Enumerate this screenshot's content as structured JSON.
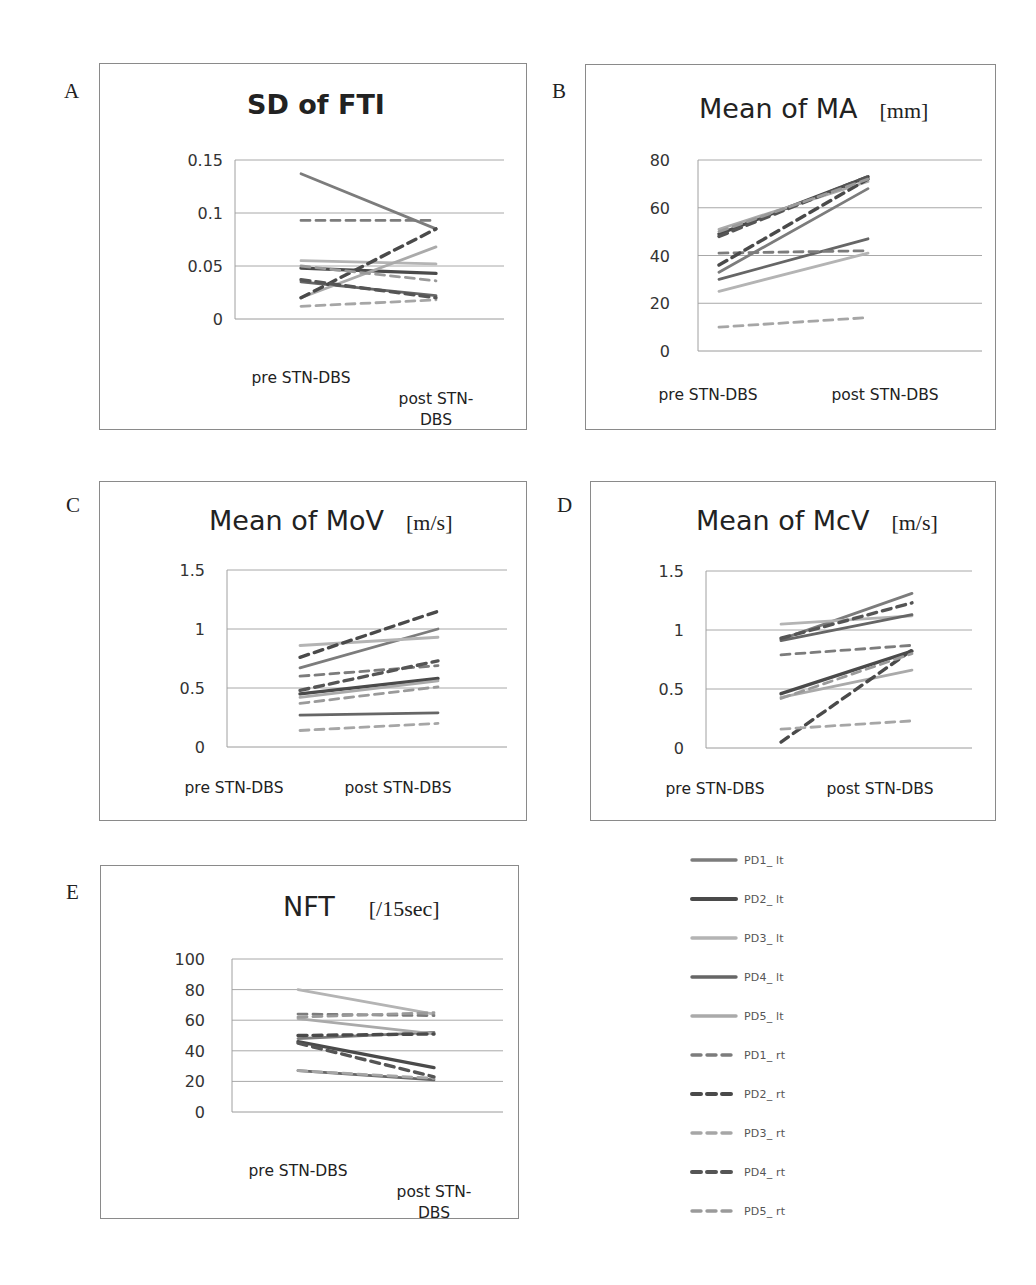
{
  "figure": {
    "panels": [
      {
        "letter": "A",
        "title": "SD of FTI",
        "unit": ""
      },
      {
        "letter": "B",
        "title": "Mean of MA",
        "unit": "[mm]"
      },
      {
        "letter": "C",
        "title": "Mean of MoV",
        "unit": "[m/s]"
      },
      {
        "letter": "D",
        "title": "Mean of McV",
        "unit": "[m/s]"
      },
      {
        "letter": "E",
        "title": "NFT",
        "unit": "[/15sec]"
      }
    ],
    "categories_wrapped": [
      "pre STN-DBS",
      "post STN-",
      "DBS"
    ],
    "categories_single": [
      "pre STN-DBS",
      "post STN-DBS"
    ]
  },
  "legend": {
    "items": [
      {
        "label": "PD1_ lt",
        "style": "solid",
        "color": "#7c7c7c"
      },
      {
        "label": "PD2_ lt",
        "style": "solid",
        "color": "#4a4a4a"
      },
      {
        "label": "PD3_ lt",
        "style": "solid",
        "color": "#b4b4b4"
      },
      {
        "label": "PD4_ lt",
        "style": "solid",
        "color": "#666666"
      },
      {
        "label": "PD5_ lt",
        "style": "solid",
        "color": "#aaaaaa"
      },
      {
        "label": "PD1_ rt",
        "style": "dashed",
        "color": "#7c7c7c"
      },
      {
        "label": "PD2_ rt",
        "style": "dashed",
        "color": "#4a4a4a"
      },
      {
        "label": "PD3_ rt",
        "style": "dashed",
        "color": "#a6a6a6"
      },
      {
        "label": "PD4_ rt",
        "style": "dashed",
        "color": "#555555"
      },
      {
        "label": "PD5_ rt",
        "style": "dashed",
        "color": "#9a9a9a"
      }
    ]
  },
  "chart_data": [
    {
      "panel": "A",
      "type": "line",
      "title": "SD of FTI",
      "xlabel": "",
      "ylabel": "",
      "categories": [
        "pre STN-DBS",
        "post STN-DBS"
      ],
      "yticks": [
        "0",
        "0.05",
        "0.1",
        "0.15"
      ],
      "ylim": [
        0,
        0.15
      ],
      "grid": true,
      "legend_position": "shared-right",
      "series": [
        {
          "name": "PD1_ lt",
          "values": [
            0.137,
            0.085
          ]
        },
        {
          "name": "PD2_ lt",
          "values": [
            0.048,
            0.043
          ]
        },
        {
          "name": "PD3_ lt",
          "values": [
            0.055,
            0.052
          ]
        },
        {
          "name": "PD4_ lt",
          "values": [
            0.035,
            0.022
          ]
        },
        {
          "name": "PD5_ lt",
          "values": [
            0.02,
            0.068
          ]
        },
        {
          "name": "PD1_ rt",
          "values": [
            0.093,
            0.093
          ]
        },
        {
          "name": "PD2_ rt",
          "values": [
            0.02,
            0.085
          ]
        },
        {
          "name": "PD3_ rt",
          "values": [
            0.012,
            0.018
          ]
        },
        {
          "name": "PD4_ rt",
          "values": [
            0.037,
            0.02
          ]
        },
        {
          "name": "PD5_ rt",
          "values": [
            0.05,
            0.036
          ]
        }
      ]
    },
    {
      "panel": "B",
      "type": "line",
      "title": "Mean of MA [mm]",
      "xlabel": "",
      "ylabel": "",
      "categories": [
        "pre STN-DBS",
        "post STN-DBS"
      ],
      "yticks": [
        "0",
        "20",
        "40",
        "60",
        "80"
      ],
      "ylim": [
        0,
        80
      ],
      "grid": true,
      "legend_position": "shared-right",
      "series": [
        {
          "name": "PD1_ lt",
          "values": [
            33,
            68
          ]
        },
        {
          "name": "PD2_ lt",
          "values": [
            49,
            73
          ]
        },
        {
          "name": "PD3_ lt",
          "values": [
            25,
            41
          ]
        },
        {
          "name": "PD4_ lt",
          "values": [
            30,
            47
          ]
        },
        {
          "name": "PD5_ lt",
          "values": [
            51,
            71
          ]
        },
        {
          "name": "PD1_ rt",
          "values": [
            41,
            42
          ]
        },
        {
          "name": "PD2_ rt",
          "values": [
            36,
            72
          ]
        },
        {
          "name": "PD3_ rt",
          "values": [
            10,
            14
          ]
        },
        {
          "name": "PD4_ rt",
          "values": [
            48,
            73
          ]
        },
        {
          "name": "PD5_ rt",
          "values": [
            50,
            72
          ]
        }
      ]
    },
    {
      "panel": "C",
      "type": "line",
      "title": "Mean of MoV [m/s]",
      "xlabel": "",
      "ylabel": "",
      "categories": [
        "pre STN-DBS",
        "post STN-DBS"
      ],
      "yticks": [
        "0",
        "0.5",
        "1",
        "1.5"
      ],
      "ylim": [
        0,
        1.5
      ],
      "grid": true,
      "legend_position": "shared-right",
      "series": [
        {
          "name": "PD1_ lt",
          "values": [
            0.67,
            1.0
          ]
        },
        {
          "name": "PD2_ lt",
          "values": [
            0.45,
            0.58
          ]
        },
        {
          "name": "PD3_ lt",
          "values": [
            0.86,
            0.93
          ]
        },
        {
          "name": "PD4_ lt",
          "values": [
            0.27,
            0.29
          ]
        },
        {
          "name": "PD5_ lt",
          "values": [
            0.42,
            0.56
          ]
        },
        {
          "name": "PD1_ rt",
          "values": [
            0.6,
            0.69
          ]
        },
        {
          "name": "PD2_ rt",
          "values": [
            0.76,
            1.15
          ]
        },
        {
          "name": "PD3_ rt",
          "values": [
            0.14,
            0.2
          ]
        },
        {
          "name": "PD4_ rt",
          "values": [
            0.48,
            0.73
          ]
        },
        {
          "name": "PD5_ rt",
          "values": [
            0.37,
            0.51
          ]
        }
      ]
    },
    {
      "panel": "D",
      "type": "line",
      "title": "Mean of McV [m/s]",
      "xlabel": "",
      "ylabel": "",
      "categories": [
        "pre STN-DBS",
        "post STN-DBS"
      ],
      "yticks": [
        "0",
        "0.5",
        "1",
        "1.5"
      ],
      "ylim": [
        0,
        1.5
      ],
      "grid": true,
      "legend_position": "shared-right",
      "series": [
        {
          "name": "PD1_ lt",
          "values": [
            0.92,
            1.31
          ]
        },
        {
          "name": "PD2_ lt",
          "values": [
            0.46,
            0.82
          ]
        },
        {
          "name": "PD3_ lt",
          "values": [
            1.05,
            1.12
          ]
        },
        {
          "name": "PD4_ lt",
          "values": [
            0.91,
            1.13
          ]
        },
        {
          "name": "PD5_ lt",
          "values": [
            0.43,
            0.66
          ]
        },
        {
          "name": "PD1_ rt",
          "values": [
            0.79,
            0.87
          ]
        },
        {
          "name": "PD2_ rt",
          "values": [
            0.05,
            0.83
          ]
        },
        {
          "name": "PD3_ rt",
          "values": [
            0.16,
            0.23
          ]
        },
        {
          "name": "PD4_ rt",
          "values": [
            0.93,
            1.23
          ]
        },
        {
          "name": "PD5_ rt",
          "values": [
            0.42,
            0.8
          ]
        }
      ]
    },
    {
      "panel": "E",
      "type": "line",
      "title": "NFT [/15sec]",
      "xlabel": "",
      "ylabel": "",
      "categories": [
        "pre STN-DBS",
        "post STN-DBS"
      ],
      "yticks": [
        "0",
        "20",
        "40",
        "60",
        "80",
        "100"
      ],
      "ylim": [
        0,
        100
      ],
      "grid": true,
      "legend_position": "shared-right",
      "series": [
        {
          "name": "PD1_ lt",
          "values": [
            48,
            52
          ]
        },
        {
          "name": "PD2_ lt",
          "values": [
            46,
            29
          ]
        },
        {
          "name": "PD3_ lt",
          "values": [
            80,
            64
          ]
        },
        {
          "name": "PD4_ lt",
          "values": [
            27,
            21
          ]
        },
        {
          "name": "PD5_ lt",
          "values": [
            61,
            51
          ]
        },
        {
          "name": "PD1_ rt",
          "values": [
            64,
            63
          ]
        },
        {
          "name": "PD2_ rt",
          "values": [
            50,
            51
          ]
        },
        {
          "name": "PD3_ rt",
          "values": [
            27,
            22
          ]
        },
        {
          "name": "PD4_ rt",
          "values": [
            45,
            23
          ]
        },
        {
          "name": "PD5_ rt",
          "values": [
            62,
            65
          ]
        }
      ]
    }
  ]
}
